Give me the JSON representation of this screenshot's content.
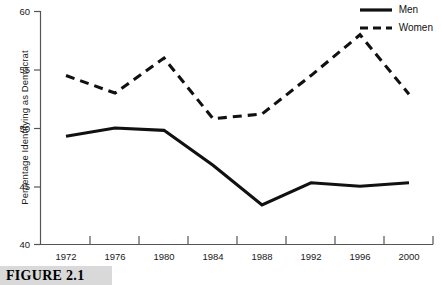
{
  "figure": {
    "caption": "FIGURE 2.1"
  },
  "legend": {
    "position": "top-right",
    "entries": [
      {
        "label": "Men",
        "style": "solid"
      },
      {
        "label": "Women",
        "style": "dashed"
      }
    ]
  },
  "axes": {
    "y_title": "Percentage Identifying as Democrat",
    "y_ticks": [
      "60",
      "55",
      "50",
      "45",
      "40"
    ],
    "x_ticks": [
      "1972",
      "1976",
      "1980",
      "1984",
      "1988",
      "1992",
      "1996",
      "2000"
    ]
  },
  "colors": {
    "line": "#111111",
    "axis": "#555555",
    "caption_band": "#d9d9d9",
    "background": "#ffffff"
  },
  "chart_data": {
    "type": "line",
    "title": "",
    "xlabel": "",
    "ylabel": "Percentage Identifying as Democrat",
    "categories": [
      1972,
      1976,
      1980,
      1984,
      1988,
      1992,
      1996,
      2000
    ],
    "xlim": [
      1972,
      2000
    ],
    "ylim": [
      40,
      60
    ],
    "yticks": [
      40,
      45,
      50,
      55,
      60
    ],
    "grid": false,
    "legend_position": "top-right",
    "series": [
      {
        "name": "Men",
        "style": "solid",
        "values": [
          49.3,
          50.0,
          49.8,
          46.8,
          43.4,
          45.3,
          45.0,
          45.3
        ]
      },
      {
        "name": "Women",
        "style": "dashed",
        "values": [
          54.5,
          53.0,
          56.0,
          50.8,
          51.2,
          54.5,
          58.0,
          52.9
        ]
      }
    ]
  }
}
